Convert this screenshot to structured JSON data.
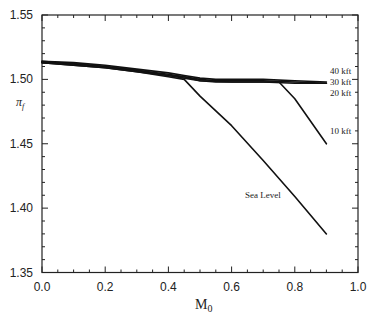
{
  "chart_data": {
    "type": "line",
    "title": "",
    "xlabel": "M",
    "xlabel_subscript": "0",
    "ylabel": "π",
    "ylabel_subscript": "f",
    "xlim": [
      0.0,
      1.0
    ],
    "ylim": [
      1.35,
      1.55
    ],
    "x_ticks": [
      "0.0",
      "0.2",
      "0.4",
      "0.6",
      "0.8",
      "1.0"
    ],
    "y_ticks": [
      "1.35",
      "1.40",
      "1.45",
      "1.50",
      "1.55"
    ],
    "grid": false,
    "legend": "inline labels at right",
    "series": [
      {
        "name": "40 kft",
        "x": [
          0.0,
          0.1,
          0.2,
          0.3,
          0.4,
          0.45,
          0.5,
          0.55,
          0.6,
          0.7,
          0.8,
          0.9
        ],
        "y": [
          1.514,
          1.513,
          1.511,
          1.508,
          1.505,
          1.503,
          1.501,
          1.5,
          1.5,
          1.5,
          1.499,
          1.498
        ]
      },
      {
        "name": "30 kft",
        "x": [
          0.0,
          0.1,
          0.2,
          0.3,
          0.4,
          0.45,
          0.5,
          0.55,
          0.6,
          0.7,
          0.8,
          0.9
        ],
        "y": [
          1.514,
          1.512,
          1.51,
          1.507,
          1.504,
          1.502,
          1.5,
          1.499,
          1.499,
          1.499,
          1.498,
          1.497
        ]
      },
      {
        "name": "20 kft",
        "x": [
          0.0,
          0.1,
          0.2,
          0.3,
          0.4,
          0.45,
          0.5,
          0.55,
          0.6,
          0.7,
          0.8,
          0.9
        ],
        "y": [
          1.513,
          1.512,
          1.51,
          1.507,
          1.503,
          1.502,
          1.499,
          1.498,
          1.498,
          1.498,
          1.497,
          1.497
        ]
      },
      {
        "name": "10 kft",
        "x": [
          0.0,
          0.1,
          0.2,
          0.3,
          0.4,
          0.45,
          0.5,
          0.6,
          0.7,
          0.75,
          0.8,
          0.9
        ],
        "y": [
          1.513,
          1.511,
          1.509,
          1.506,
          1.503,
          1.501,
          1.499,
          1.498,
          1.498,
          1.498,
          1.485,
          1.45
        ]
      },
      {
        "name": "Sea Level",
        "x": [
          0.0,
          0.1,
          0.2,
          0.3,
          0.4,
          0.45,
          0.5,
          0.6,
          0.7,
          0.8,
          0.9
        ],
        "y": [
          1.513,
          1.511,
          1.509,
          1.506,
          1.502,
          1.5,
          1.487,
          1.464,
          1.437,
          1.409,
          1.38
        ]
      }
    ],
    "annotations": [
      {
        "text": "40 kft",
        "x_px": 330,
        "y_px": 74
      },
      {
        "text": "30 kft",
        "x_px": 330,
        "y_px": 85
      },
      {
        "text": "20 kft",
        "x_px": 330,
        "y_px": 96
      },
      {
        "text": "10 kft",
        "x_px": 330,
        "y_px": 134
      },
      {
        "text": "Sea Level",
        "x_px": 245,
        "y_px": 198
      }
    ]
  },
  "labels": {
    "x_tick_0": "0.0",
    "x_tick_1": "0.2",
    "x_tick_2": "0.4",
    "x_tick_3": "0.6",
    "x_tick_4": "0.8",
    "x_tick_5": "1.0",
    "y_tick_0": "1.35",
    "y_tick_1": "1.40",
    "y_tick_2": "1.45",
    "y_tick_3": "1.50",
    "y_tick_4": "1.55",
    "x_axis_main": "M",
    "x_axis_sub": "0",
    "y_axis_main": "π",
    "y_axis_sub": "f",
    "series_40": "40 kft",
    "series_30": "30 kft",
    "series_20": "20 kft",
    "series_10": "10 kft",
    "series_sl": "Sea Level"
  }
}
